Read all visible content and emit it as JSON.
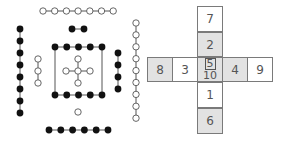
{
  "figure": {
    "colors": {
      "line": "#555555",
      "filled": "#111111",
      "open_fill": "#ffffff",
      "cell_border": "#7a7a7a",
      "shaded_cell": "#e2e2e2",
      "text": "#555555"
    }
  },
  "dot_diagram": {
    "groups": [
      {
        "name": "top-open-row",
        "type": "open",
        "count": 7,
        "orientation": "horizontal",
        "x0": 43,
        "y0": 11,
        "step": 11.7
      },
      {
        "name": "top-filled-pair",
        "type": "filled",
        "count": 2,
        "orientation": "horizontal",
        "x0": 72,
        "y0": 29,
        "step": 12
      },
      {
        "name": "left-filled-column",
        "type": "filled",
        "count": 8,
        "orientation": "vertical",
        "x0": 20,
        "y0": 29,
        "step": 12
      },
      {
        "name": "left-open-column",
        "type": "open",
        "count": 3,
        "orientation": "vertical",
        "x0": 38,
        "y0": 59,
        "step": 12
      },
      {
        "name": "square-top-row",
        "type": "filled",
        "count": 5,
        "orientation": "horizontal",
        "x0": 55,
        "y0": 47,
        "step": 11.75
      },
      {
        "name": "square-bottom-row",
        "type": "filled",
        "count": 5,
        "orientation": "horizontal",
        "x0": 55,
        "y0": 95,
        "step": 11.75
      },
      {
        "name": "right-filled-column",
        "type": "filled",
        "count": 4,
        "orientation": "vertical",
        "x0": 118,
        "y0": 53,
        "step": 12
      },
      {
        "name": "right-open-column",
        "type": "open",
        "count": 9,
        "orientation": "vertical",
        "x0": 136,
        "y0": 23,
        "step": 11.9
      },
      {
        "name": "bottom-open-single",
        "type": "open",
        "count": 1,
        "orientation": "horizontal",
        "x0": 78,
        "y0": 112,
        "step": 0
      },
      {
        "name": "bottom-filled-row",
        "type": "filled",
        "count": 6,
        "orientation": "horizontal",
        "x0": 49,
        "y0": 130,
        "step": 11.8
      }
    ],
    "center_cross": {
      "center": [
        78,
        71
      ],
      "arm": 12,
      "type": "open"
    },
    "square_sides": {
      "left_x": 55,
      "right_x": 102,
      "top_y": 47,
      "bottom_y": 95
    }
  },
  "number_cross": {
    "cells": [
      {
        "id": "cell-7",
        "label": "7",
        "x": 197,
        "y": 6,
        "w": 26,
        "h": 26,
        "shaded": false
      },
      {
        "id": "cell-2",
        "label": "2",
        "x": 197,
        "y": 32,
        "w": 26,
        "h": 25,
        "shaded": true
      },
      {
        "id": "cell-8",
        "label": "8",
        "x": 147,
        "y": 57,
        "w": 26,
        "h": 25,
        "shaded": true
      },
      {
        "id": "cell-3",
        "label": "3",
        "x": 172,
        "y": 57,
        "w": 26,
        "h": 25,
        "shaded": false
      },
      {
        "id": "cell-center",
        "label": "5",
        "sublabel": "10",
        "x": 197,
        "y": 57,
        "w": 26,
        "h": 25,
        "shaded": true
      },
      {
        "id": "cell-4",
        "label": "4",
        "x": 222,
        "y": 57,
        "w": 26,
        "h": 25,
        "shaded": true
      },
      {
        "id": "cell-9",
        "label": "9",
        "x": 247,
        "y": 57,
        "w": 26,
        "h": 25,
        "shaded": false
      },
      {
        "id": "cell-1",
        "label": "1",
        "x": 197,
        "y": 82,
        "w": 26,
        "h": 26,
        "shaded": false
      },
      {
        "id": "cell-6",
        "label": "6",
        "x": 197,
        "y": 108,
        "w": 26,
        "h": 26,
        "shaded": true
      }
    ]
  }
}
